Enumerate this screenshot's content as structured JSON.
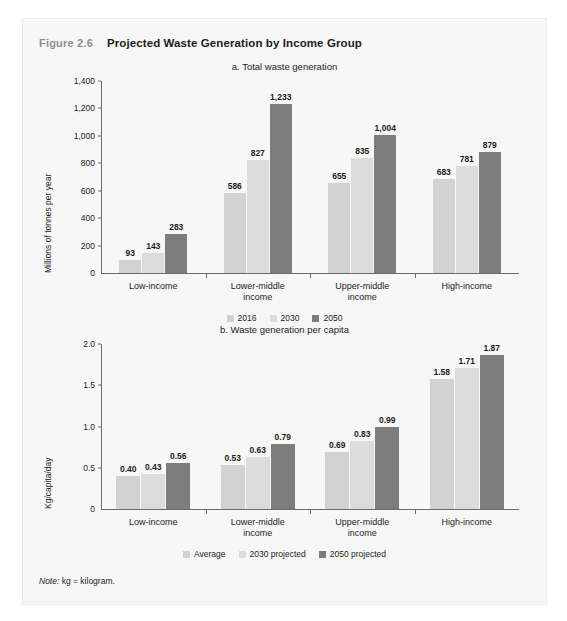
{
  "figure": {
    "number": "Figure 2.6",
    "title": "Projected Waste Generation by Income Group",
    "note_prefix": "Note:",
    "note_text": " kg = kilogram."
  },
  "colors": {
    "series_2016": "#d2d2d2",
    "series_2030": "#dcdcdc",
    "series_2050": "#7d7d7d",
    "card_background": "#f7f7f7",
    "axis": "#6b6b6b",
    "text": "#1c1c1c",
    "figure_number": "#8d9096"
  },
  "chart_data": [
    {
      "id": "total-waste-generation",
      "type": "bar",
      "title": "a. Total waste generation",
      "xlabel": "",
      "ylabel": "Millions of tonnes per year",
      "ylim": [
        0,
        1400
      ],
      "yticks": [
        0,
        200,
        400,
        600,
        800,
        1000,
        1200,
        1400
      ],
      "ytick_labels": [
        "0",
        "200",
        "400",
        "600",
        "800",
        "1,000",
        "1,200",
        "1,400"
      ],
      "grid": false,
      "legend_position": "bottom",
      "categories": [
        "Low-income",
        "Lower-middle income",
        "Upper-middle income",
        "High-income"
      ],
      "category_lines": [
        [
          "Low-income"
        ],
        [
          "Lower-middle",
          "income"
        ],
        [
          "Upper-middle",
          "income"
        ],
        [
          "High-income"
        ]
      ],
      "series": [
        {
          "name": "2016",
          "values": [
            93,
            586,
            655,
            683
          ],
          "labels": [
            "93",
            "586",
            "655",
            "683"
          ]
        },
        {
          "name": "2030",
          "values": [
            143,
            827,
            835,
            781
          ],
          "labels": [
            "143",
            "827",
            "835",
            "781"
          ]
        },
        {
          "name": "2050",
          "values": [
            283,
            1233,
            1004,
            879
          ],
          "labels": [
            "283",
            "1,233",
            "1,004",
            "879"
          ]
        }
      ]
    },
    {
      "id": "waste-generation-per-capita",
      "type": "bar",
      "title": "b. Waste generation per capita",
      "xlabel": "",
      "ylabel": "Kg/capita/day",
      "ylim": [
        0,
        2.0
      ],
      "yticks": [
        0,
        0.5,
        1.0,
        1.5,
        2.0
      ],
      "ytick_labels": [
        "0",
        "0.5",
        "1.0",
        "1.5",
        "2.0"
      ],
      "grid": false,
      "legend_position": "bottom",
      "categories": [
        "Low-income",
        "Lower-middle income",
        "Upper-middle income",
        "High-income"
      ],
      "category_lines": [
        [
          "Low-income"
        ],
        [
          "Lower-middle",
          "income"
        ],
        [
          "Upper-middle",
          "income"
        ],
        [
          "High-income"
        ]
      ],
      "series": [
        {
          "name": "Average",
          "values": [
            0.4,
            0.53,
            0.69,
            1.58
          ],
          "labels": [
            "0.40",
            "0.53",
            "0.69",
            "1.58"
          ]
        },
        {
          "name": "2030 projected",
          "values": [
            0.43,
            0.63,
            0.83,
            1.71
          ],
          "labels": [
            "0.43",
            "0.63",
            "0.83",
            "1.71"
          ]
        },
        {
          "name": "2050 projected",
          "values": [
            0.56,
            0.79,
            0.99,
            1.87
          ],
          "labels": [
            "0.56",
            "0.79",
            "0.99",
            "1.87"
          ]
        }
      ]
    }
  ]
}
